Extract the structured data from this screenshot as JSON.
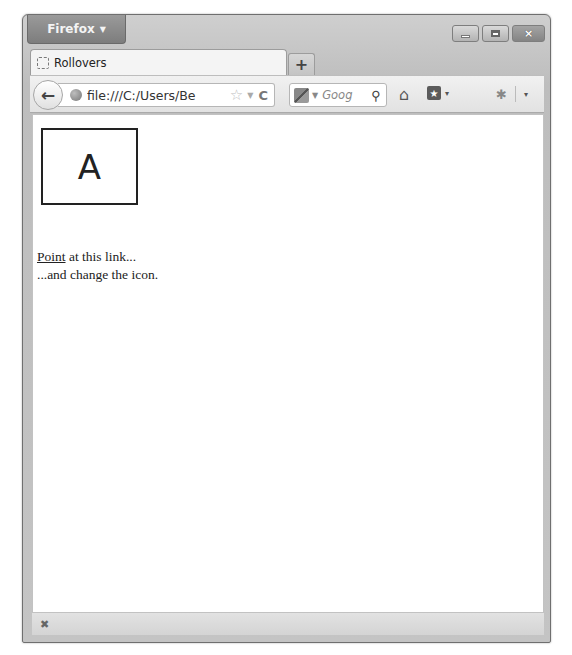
{
  "window": {
    "app_menu_label": "Firefox",
    "controls": {
      "minimize": "minimize",
      "maximize": "maximize",
      "close": "×"
    }
  },
  "tabs": [
    {
      "title": "Rollovers",
      "favicon": "blank-page-icon",
      "active": true
    }
  ],
  "new_tab_label": "+",
  "navbar": {
    "back_icon": "←",
    "url": "file:///C:/Users/Be",
    "bookmark_star": "☆",
    "history_dropdown": "▼",
    "reload_icon": "C",
    "search": {
      "engine": "google-icon",
      "query_placeholder": "Goog",
      "search_icon": "⌕"
    },
    "home_icon": "⌂",
    "bookmarks_icon": "★",
    "addon_icon": "✱",
    "dropdown_caret": "▾"
  },
  "page": {
    "rollover_image_letter": "A",
    "link_text": "Point",
    "line1_rest": " at this link...",
    "line2": "...and change the icon."
  },
  "statusbar": {
    "close_icon": "✖"
  }
}
